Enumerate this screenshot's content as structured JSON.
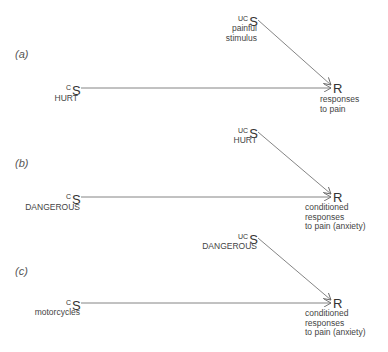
{
  "diagram": {
    "colors": {
      "line": "#777777",
      "text": "#3f3f3f"
    },
    "panels": [
      {
        "label": "(a)",
        "ucs": {
          "prefix": "UC",
          "symbol": "S",
          "caption": [
            "painful",
            "stimulus"
          ]
        },
        "cs": {
          "prefix": "C",
          "symbol": "S",
          "caption": "HURT"
        },
        "response": {
          "symbol": "R",
          "caption": [
            "responses",
            "to pain"
          ]
        }
      },
      {
        "label": "(b)",
        "ucs": {
          "prefix": "UC",
          "symbol": "S",
          "caption": [
            "HURT"
          ]
        },
        "cs": {
          "prefix": "C",
          "symbol": "S",
          "caption": "DANGEROUS"
        },
        "response": {
          "symbol": "R",
          "caption": [
            "conditioned",
            "responses",
            "to pain (anxiety)"
          ]
        }
      },
      {
        "label": "(c)",
        "ucs": {
          "prefix": "UC",
          "symbol": "S",
          "caption": [
            "DANGEROUS"
          ]
        },
        "cs": {
          "prefix": "C",
          "symbol": "S",
          "caption": "motorcycles"
        },
        "response": {
          "symbol": "R",
          "caption": [
            "conditioned",
            "responses",
            "to pain (anxiety)"
          ]
        }
      }
    ]
  }
}
